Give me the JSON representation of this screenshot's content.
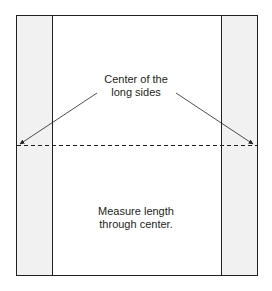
{
  "diagram": {
    "labels": {
      "center_line1": "Center of the",
      "center_line2": "long sides",
      "measure_line1": "Measure length",
      "measure_line2": "through center."
    },
    "colors": {
      "stroke": "#231f20",
      "side_panel_fill": "#f1f1f2",
      "background": "#ffffff"
    }
  }
}
